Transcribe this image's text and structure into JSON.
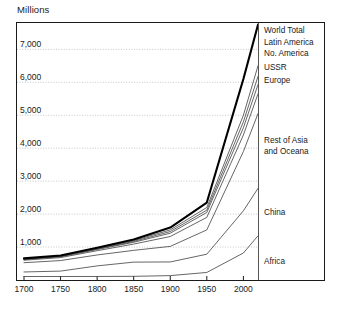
{
  "chart_data": {
    "type": "area",
    "title": "Millions",
    "ylabel": "Millions",
    "xlabel": "",
    "grid": true,
    "legend_position": "right",
    "xlim": [
      1700,
      2020
    ],
    "ylim": [
      0,
      7800
    ],
    "x_ticks": [
      1700,
      1750,
      1800,
      1850,
      1900,
      1950,
      2000
    ],
    "x_tick_labels": [
      "1700",
      "1750",
      "1800",
      "1850",
      "1900",
      "1950",
      "2000"
    ],
    "y_ticks": [
      1000,
      2000,
      3000,
      4000,
      5000,
      6000,
      7000
    ],
    "y_tick_labels": [
      "1,000",
      "2,000",
      "3,000",
      "4,000",
      "5,000",
      "6,000",
      "7,000"
    ],
    "x": [
      1700,
      1750,
      1800,
      1850,
      1900,
      1950,
      2000,
      2020
    ],
    "stacking": "cumulative",
    "note": "Lines are cumulative totals; topmost bold line is World Total.",
    "series": [
      {
        "name": "Africa",
        "cumulative": [
          106,
          106,
          107,
          111,
          133,
          229,
          819,
          1340
        ]
      },
      {
        "name": "China",
        "cumulative": [
          244,
          270,
          428,
          543,
          548,
          783,
          2100,
          2780
        ]
      },
      {
        "name": "Rest of Asia and Oceana",
        "cumulative": [
          525,
          590,
          760,
          900,
          1020,
          1520,
          3900,
          5050
        ]
      },
      {
        "name": "Europe",
        "cumulative": [
          600,
          680,
          890,
          1090,
          1320,
          1900,
          4400,
          5650
        ]
      },
      {
        "name": "USSR",
        "cumulative": [
          620,
          705,
          925,
          1145,
          1420,
          2050,
          4620,
          5930
        ]
      },
      {
        "name": "No. America",
        "cumulative": [
          630,
          716,
          940,
          1170,
          1470,
          2120,
          4800,
          6180
        ]
      },
      {
        "name": "Latin America",
        "cumulative": [
          640,
          728,
          957,
          1195,
          1520,
          2200,
          5000,
          6500
        ]
      },
      {
        "name": "World Total",
        "cumulative": [
          655,
          745,
          980,
          1230,
          1590,
          2350,
          6100,
          7750
        ],
        "emphasis": true
      }
    ],
    "legend_entries": [
      {
        "label": "World Total",
        "top": 26
      },
      {
        "label": "Latin America",
        "top": 38
      },
      {
        "label": "No. America",
        "top": 49
      },
      {
        "label": "USSR",
        "top": 63
      },
      {
        "label": "Europe",
        "top": 76
      },
      {
        "label": "Rest of Asia",
        "top": 136
      },
      {
        "label": "and Oceana",
        "top": 147
      },
      {
        "label": "China",
        "top": 208
      },
      {
        "label": "Africa",
        "top": 257
      }
    ],
    "colors": {
      "line": "#4a4a4a",
      "world_total": "#000000",
      "grid": "#b9b9b9",
      "frame": "#1a1a1a",
      "text": "#1a1a1a",
      "background": "#ffffff"
    }
  }
}
